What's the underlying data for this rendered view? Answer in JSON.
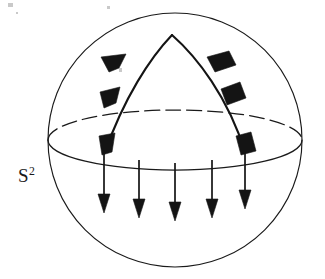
{
  "figure": {
    "domain": "Diagram",
    "background_color": "#ffffff",
    "ink_color": "#1a1a1a",
    "width": 325,
    "height": 279
  },
  "labels": {
    "sphere": {
      "base": "S",
      "exponent": "2",
      "x": 18,
      "y": 166
    }
  },
  "sphere": {
    "center_x": 175,
    "center_y": 140,
    "radius": 127,
    "stroke_width": 1.15
  },
  "equator": {
    "center_x": 175,
    "center_y": 140,
    "semi_major": 127,
    "semi_minor": 30,
    "back_half_style": "dashed",
    "front_half_style": "solid",
    "dash_pattern": "15 6"
  },
  "geodesic_spike": {
    "apex_x": 172,
    "apex_y": 35,
    "left_foot_x": 105,
    "left_foot_y": 152,
    "right_foot_x": 245,
    "right_foot_y": 152,
    "stroke_width": 2.1,
    "description": "Two geodesic arcs meeting at a cusp at the north pole region and descending to the equator"
  },
  "tangent_arrows": {
    "count": 6,
    "direction": "downward along the geodesic arcs, away from the apex",
    "left_branch": [
      {
        "x": 113,
        "y": 62,
        "angle_deg": 213
      },
      {
        "x": 110,
        "y": 97,
        "angle_deg": 236
      },
      {
        "x": 105,
        "y": 145,
        "angle_deg": 255
      }
    ],
    "right_branch": [
      {
        "x": 211,
        "y": 61,
        "angle_deg": 327
      },
      {
        "x": 232,
        "y": 96,
        "angle_deg": 303
      },
      {
        "x": 244,
        "y": 144,
        "angle_deg": 285
      }
    ]
  },
  "field_arrows": {
    "count": 5,
    "direction": "straight down",
    "items": [
      {
        "x": 104,
        "y_start": 152,
        "y_end": 212
      },
      {
        "x": 139,
        "y_start": 160,
        "y_end": 216
      },
      {
        "x": 175,
        "y_start": 163,
        "y_end": 219
      },
      {
        "x": 212,
        "y_start": 160,
        "y_end": 216
      },
      {
        "x": 245,
        "y_start": 152,
        "y_end": 207
      }
    ]
  },
  "artifacts": {
    "specks": [
      {
        "x": 8,
        "y": 3,
        "w": 5,
        "h": 4
      },
      {
        "x": 107,
        "y": 6,
        "w": 3,
        "h": 3
      },
      {
        "x": 119,
        "y": 68,
        "w": 3,
        "h": 4
      },
      {
        "x": 16,
        "y": 12,
        "w": 2,
        "h": 2
      }
    ]
  }
}
